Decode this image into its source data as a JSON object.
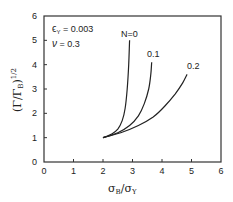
{
  "chart_data": {
    "type": "line",
    "title": "",
    "xlabel": "σB/σY",
    "ylabel": "(Γ/ΓB)^1/2",
    "xlim": [
      0,
      6
    ],
    "ylim": [
      0,
      6
    ],
    "xticks": [
      "0",
      "1",
      "2",
      "3",
      "4",
      "5",
      "6"
    ],
    "yticks": [
      "0",
      "1",
      "2",
      "3",
      "4",
      "5",
      "6"
    ],
    "grid": false,
    "annotations": [
      {
        "text": "εY = 0.003"
      },
      {
        "text": "ν = 0.3"
      }
    ],
    "series": [
      {
        "name": "N=0",
        "x": [
          2.0,
          2.3,
          2.5,
          2.65,
          2.75,
          2.82,
          2.87,
          2.9
        ],
        "y": [
          1.0,
          1.15,
          1.35,
          1.7,
          2.2,
          3.0,
          4.0,
          5.0
        ]
      },
      {
        "name": "0.1",
        "x": [
          2.0,
          2.5,
          2.9,
          3.2,
          3.4,
          3.55,
          3.62,
          3.65
        ],
        "y": [
          1.0,
          1.2,
          1.5,
          1.9,
          2.4,
          3.0,
          3.6,
          4.1
        ]
      },
      {
        "name": "0.2",
        "x": [
          2.0,
          2.6,
          3.2,
          3.7,
          4.1,
          4.45,
          4.7,
          4.85
        ],
        "y": [
          1.0,
          1.2,
          1.5,
          1.85,
          2.3,
          2.8,
          3.25,
          3.6
        ]
      }
    ]
  },
  "labels": {
    "eps": "ϵ",
    "eps_sub": "Y",
    "eps_val": " = 0.003",
    "nu": "ν",
    "nu_val": " = 0.3",
    "series_n0": "N=0",
    "series_01": "0.1",
    "series_02": "0.2",
    "x_sigma1": "σ",
    "x_sub1": "B",
    "x_slash": "/σ",
    "x_sub2": "Y",
    "y_label": "(Γ/Γ",
    "y_sub": "B",
    "y_close": ")",
    "y_exp": "1/2"
  }
}
